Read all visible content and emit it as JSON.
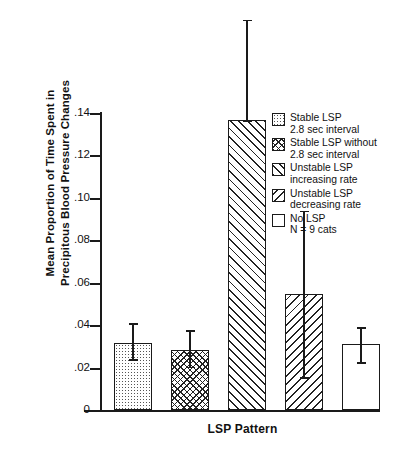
{
  "chart_data": {
    "type": "bar",
    "title": "",
    "xlabel": "LSP Pattern",
    "ylabel_line1": "Mean Proportion of Time Spent in",
    "ylabel_line2": "Precipitous Blood Pressure Changes",
    "ylim": [
      0,
      0.145
    ],
    "yticks": [
      "0",
      ".02",
      ".04",
      ".06",
      ".08",
      ".10",
      ".12",
      ".14"
    ],
    "ytick_values": [
      0,
      0.02,
      0.04,
      0.06,
      0.08,
      0.1,
      0.12,
      0.14
    ],
    "grid": false,
    "legend_position": "right",
    "sample_size_note": "N = 9 cats",
    "categories": [
      "Stable LSP 2.8 sec interval",
      "Stable LSP without 2.8 sec interval",
      "Unstable LSP increasing rate",
      "Unstable LSP decreasing rate",
      "No LSP"
    ],
    "values": [
      0.0315,
      0.0285,
      0.1365,
      0.0545,
      0.031
    ],
    "error_upper": [
      0.041,
      0.0375,
      0.184,
      0.094,
      0.039
    ],
    "error_lower": [
      0.024,
      0.0205,
      0.1365,
      0.0155,
      0.0225
    ],
    "patterns": [
      "dotted",
      "cross-hatch",
      "diagonal-forward",
      "diagonal-backward",
      "blank"
    ]
  },
  "legend": {
    "items": [
      {
        "pattern": "dotted",
        "line1": "Stable LSP",
        "line2": "2.8 sec interval"
      },
      {
        "pattern": "cross-hatch",
        "line1": "Stable LSP without",
        "line2": "2.8 sec interval"
      },
      {
        "pattern": "diagonal-forward",
        "line1": "Unstable LSP",
        "line2": "increasing rate"
      },
      {
        "pattern": "diagonal-backward",
        "line1": "Unstable LSP",
        "line2": "decreasing rate"
      },
      {
        "pattern": "blank",
        "line1": "No LSP",
        "line2": "N = 9 cats"
      }
    ]
  }
}
